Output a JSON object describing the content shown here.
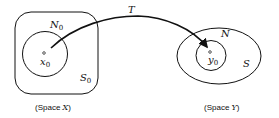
{
  "diagram": {
    "space_x": {
      "caption_prefix": "(Space ",
      "caption_var": "X",
      "caption_suffix": ")",
      "outer_set": {
        "label": "S",
        "subscript": "0"
      },
      "inner_set": {
        "label": "N",
        "subscript": "0"
      },
      "point": {
        "label": "x",
        "subscript": "0"
      }
    },
    "space_y": {
      "caption_prefix": "(Space ",
      "caption_var": "Y",
      "caption_suffix": ")",
      "outer_set": {
        "label": "S",
        "subscript": ""
      },
      "inner_set": {
        "label": "N",
        "subscript": ""
      },
      "point": {
        "label": "y",
        "subscript": "0"
      }
    },
    "mapping": {
      "label": "T"
    },
    "colors": {
      "stroke": "#111111",
      "background": "#ffffff"
    }
  }
}
